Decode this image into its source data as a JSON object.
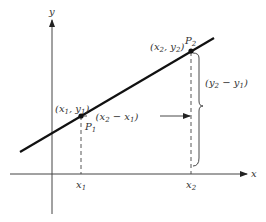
{
  "diagram": {
    "axes": {
      "x_label": "x",
      "y_label": "y"
    },
    "points": {
      "p1": {
        "name": "P",
        "sub": "1",
        "coord": "(x ₁, y ₁)",
        "coord_parts": [
          "(x",
          "1",
          ", y",
          "1",
          ")"
        ]
      },
      "p2": {
        "name": "P",
        "sub": "2",
        "coord_parts": [
          "(x",
          "2",
          ", y",
          "2",
          ")"
        ]
      }
    },
    "ticks": {
      "x1": {
        "base": "x",
        "sub": "1"
      },
      "x2": {
        "base": "x",
        "sub": "2"
      }
    },
    "run_label": {
      "parts": [
        "(x",
        "2",
        " − x",
        "1",
        ")"
      ]
    },
    "rise_label": {
      "parts": [
        "(y",
        "2",
        " − y",
        "1",
        ")"
      ]
    },
    "colors": {
      "line": "#111111",
      "axis": "#444444",
      "text": "#333333"
    }
  }
}
